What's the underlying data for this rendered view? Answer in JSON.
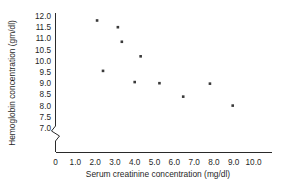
{
  "chart_data": {
    "type": "scatter",
    "title": "",
    "xlabel": "Serum creatinine concentration (mg/dl)",
    "ylabel": "Hemoglobin concentration (gm/dl)",
    "xlim": [
      0,
      10.5
    ],
    "ylim": [
      6.75,
      12.25
    ],
    "grid": false,
    "legend": false,
    "y_axis_break": true,
    "xticks": [
      "0",
      "1.0",
      "2.0",
      "3.0",
      "4.0",
      "5.0",
      "6.0",
      "7.0",
      "8.0",
      "9.0",
      "10.0"
    ],
    "xtick_values": [
      0,
      1.0,
      2.0,
      3.0,
      4.0,
      5.0,
      6.0,
      7.0,
      8.0,
      9.0,
      10.0
    ],
    "yticks": [
      "7.0",
      "7.5",
      "8.0",
      "8.5",
      "9.0",
      "9.5",
      "10.0",
      "10.5",
      "11.0",
      "11.5",
      "12.0"
    ],
    "ytick_values": [
      7.0,
      7.5,
      8.0,
      8.5,
      9.0,
      9.5,
      10.0,
      10.5,
      11.0,
      11.5,
      12.0
    ],
    "marker": "square",
    "marker_color": "#3a3a3a",
    "points": [
      {
        "x": 2.1,
        "y": 11.8
      },
      {
        "x": 3.15,
        "y": 11.5
      },
      {
        "x": 3.35,
        "y": 10.85
      },
      {
        "x": 4.3,
        "y": 10.2
      },
      {
        "x": 2.4,
        "y": 9.55
      },
      {
        "x": 4.0,
        "y": 9.05
      },
      {
        "x": 5.25,
        "y": 9.0
      },
      {
        "x": 7.8,
        "y": 8.98
      },
      {
        "x": 6.45,
        "y": 8.4
      },
      {
        "x": 8.95,
        "y": 8.0
      }
    ]
  }
}
